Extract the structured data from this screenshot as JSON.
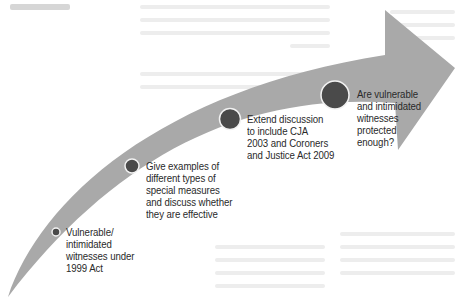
{
  "diagram": {
    "type": "curved-progression-arrow",
    "colors": {
      "arrow_fill": "#a9a9a9",
      "circle_fill": "#4a4a4a",
      "circle_ring": "#f2f2f2",
      "text": "#2a2a2a",
      "background": "#ffffff"
    },
    "milestones": [
      {
        "step": 1,
        "size": "small",
        "label": "Vulnerable/\nintimidated\nwitnesses under\n1999 Act"
      },
      {
        "step": 2,
        "size": "medium",
        "label": "Give examples of\ndifferent types of\nspecial measures\nand discuss whether\nthey are effective"
      },
      {
        "step": 3,
        "size": "large",
        "label": "Extend discussion\nto include CJA\n2003 and Coroners\nand Justice Act 2009"
      },
      {
        "step": 4,
        "size": "largest",
        "label": "Are vulnerable\nand intimidated\nwitnesses\nprotected\nenough?"
      }
    ]
  }
}
